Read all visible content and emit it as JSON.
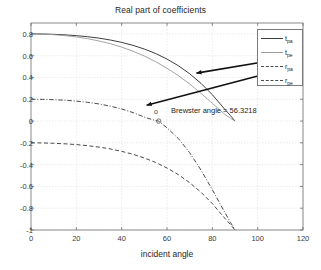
{
  "chart_data": {
    "type": "line",
    "title": "Real part of coefficients",
    "xlabel": "incident angle",
    "ylabel": "",
    "xlim": [
      0,
      120
    ],
    "ylim": [
      -1,
      0.9
    ],
    "xticks": [
      0,
      20,
      40,
      60,
      80,
      100,
      120
    ],
    "yticks": [
      0.8,
      0.6,
      0.4,
      0.2,
      0,
      -0.2,
      -0.4,
      -0.6,
      -0.8,
      -1
    ],
    "xtick_labels": [
      "0",
      "20",
      "40",
      "60",
      "80",
      "100",
      "120"
    ],
    "ytick_labels": [
      "0.8",
      "0.6",
      "0.4",
      "0.2",
      "0",
      "-0.2",
      "-0.4",
      "-0.6",
      "-0.8",
      "-1"
    ],
    "grid": true,
    "legend_position": "top-right",
    "series": [
      {
        "name": "t_pa",
        "label": "t",
        "sublabel": "pa",
        "style": "solid",
        "color": "#3f3f3f",
        "x": [
          0,
          5,
          10,
          15,
          20,
          25,
          30,
          35,
          40,
          45,
          50,
          55,
          60,
          65,
          70,
          75,
          80,
          85,
          88,
          90
        ],
        "y": [
          0.8,
          0.799,
          0.796,
          0.791,
          0.784,
          0.774,
          0.761,
          0.744,
          0.722,
          0.695,
          0.661,
          0.62,
          0.569,
          0.508,
          0.434,
          0.346,
          0.242,
          0.12,
          0.05,
          0.0
        ]
      },
      {
        "name": "t_pe",
        "label": "t",
        "sublabel": "pe",
        "style": "solid-light",
        "color": "#9a9a9a",
        "x": [
          0,
          5,
          10,
          15,
          20,
          25,
          30,
          35,
          40,
          45,
          50,
          55,
          60,
          65,
          70,
          75,
          80,
          85,
          88,
          90
        ],
        "y": [
          0.8,
          0.798,
          0.793,
          0.784,
          0.772,
          0.756,
          0.735,
          0.71,
          0.679,
          0.641,
          0.597,
          0.545,
          0.485,
          0.417,
          0.34,
          0.255,
          0.163,
          0.07,
          0.025,
          0.0
        ]
      },
      {
        "name": "r_pa",
        "label": "r",
        "sublabel": "pa",
        "style": "dashdot",
        "color": "#4a4a4a",
        "x": [
          0,
          5,
          10,
          15,
          20,
          25,
          30,
          35,
          40,
          45,
          50,
          55,
          56.3218,
          60,
          65,
          70,
          75,
          80,
          85,
          88,
          90
        ],
        "y": [
          0.2,
          0.199,
          0.196,
          0.191,
          0.183,
          0.172,
          0.157,
          0.137,
          0.111,
          0.078,
          0.036,
          0.004,
          0.0,
          -0.062,
          -0.16,
          -0.29,
          -0.45,
          -0.63,
          -0.82,
          -0.93,
          -1.0
        ]
      },
      {
        "name": "r_pe",
        "label": "r",
        "sublabel": "pe",
        "style": "dash",
        "color": "#4a4a4a",
        "x": [
          0,
          5,
          10,
          15,
          20,
          25,
          30,
          35,
          40,
          45,
          50,
          55,
          60,
          65,
          70,
          75,
          80,
          85,
          88,
          90
        ],
        "y": [
          -0.2,
          -0.201,
          -0.204,
          -0.209,
          -0.216,
          -0.226,
          -0.239,
          -0.256,
          -0.278,
          -0.305,
          -0.339,
          -0.38,
          -0.431,
          -0.492,
          -0.566,
          -0.654,
          -0.758,
          -0.88,
          -0.95,
          -1.0
        ]
      }
    ],
    "annotations": [
      {
        "name": "brewster-angle",
        "text": "Brewster angle = 56.3218",
        "marker_label": "o",
        "marker_x": 56.3218,
        "marker_y": 0.0
      }
    ],
    "arrows": [
      {
        "name": "arrow-t-pe",
        "from_x": 103,
        "from_y": 0.545,
        "to_x": 73,
        "to_y": 0.44
      },
      {
        "name": "arrow-r-pa",
        "from_x": 103,
        "from_y": 0.43,
        "to_x": 51,
        "to_y": 0.145
      }
    ]
  },
  "legend": {
    "items": [
      {
        "label": "t",
        "sub": "pa",
        "style": "solid"
      },
      {
        "label": "t",
        "sub": "pe",
        "style": "solid-light"
      },
      {
        "label": "r",
        "sub": "pa",
        "style": "dashdot"
      },
      {
        "label": "r",
        "sub": "pe",
        "style": "dash"
      }
    ]
  }
}
